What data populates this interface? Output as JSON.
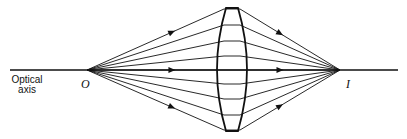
{
  "labels": {
    "axis_line1": "Optical",
    "axis_line2": "axis",
    "object_point": "O",
    "image_point": "I"
  },
  "geometry": {
    "object": [
      87,
      70
    ],
    "image": [
      340,
      70
    ],
    "lens_x": 232,
    "ray_heights": [
      9,
      25,
      41,
      56,
      70,
      84,
      99,
      115,
      130
    ]
  },
  "colors": {
    "line": "#111111",
    "background": "#ffffff"
  }
}
